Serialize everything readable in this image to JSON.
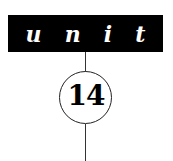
{
  "header": {
    "letters": [
      "u",
      "n",
      "i",
      "t"
    ]
  },
  "badge": {
    "number": "14"
  },
  "colors": {
    "bar": "#000000",
    "text_on_bar": "#ffffff",
    "line": "#333333"
  }
}
